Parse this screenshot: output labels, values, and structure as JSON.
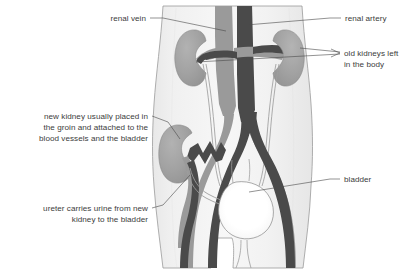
{
  "figure": {
    "background_color": "#ffffff",
    "body_fill": "#f2f2f2",
    "body_outline": "#8c8c8c",
    "kidney_color": "#a0a0a0",
    "kidney_outline": "#8a8a8a",
    "artery_color": "#4a4a4a",
    "vein_color": "#9a9a9a",
    "bladder_color": "#ffffff",
    "bladder_outline": "#8f8f8f",
    "ureter_color": "#9a9a9a",
    "text_color": "#3c3c3c",
    "leader_color": "#4a4a4a"
  },
  "labels": {
    "renal_vein": {
      "lines": [
        "renal vein"
      ],
      "align": "end",
      "x": 146,
      "y": 21
    },
    "renal_artery": {
      "lines": [
        "renal artery"
      ],
      "align": "start",
      "x": 345,
      "y": 21
    },
    "old_kidneys": {
      "lines": [
        "old kidneys left",
        "in the body"
      ],
      "align": "start",
      "x": 344,
      "y": 62
    },
    "new_kidney": {
      "lines": [
        "new kidney usually placed in",
        "the groin and attached to the",
        "blood vessels and the bladder"
      ],
      "align": "end",
      "x": 148,
      "y": 119
    },
    "ureter": {
      "lines": [
        "ureter carries urine from new",
        "kidney to the bladder"
      ],
      "align": "end",
      "x": 148,
      "y": 211
    },
    "bladder": {
      "lines": [
        "bladder"
      ],
      "align": "start",
      "x": 344,
      "y": 182
    }
  },
  "anatomy": {
    "parts": [
      "torso-silhouette",
      "inferior-vena-cava",
      "abdominal-aorta",
      "left-kidney-old",
      "right-kidney-old",
      "left-renal-vein",
      "right-renal-vein",
      "left-renal-artery",
      "right-renal-artery",
      "left-ureter",
      "right-ureter",
      "iliac-arteries",
      "iliac-veins",
      "new-kidney-transplant",
      "new-kidney-vessels",
      "new-kidney-ureter",
      "bladder",
      "urethra"
    ]
  }
}
